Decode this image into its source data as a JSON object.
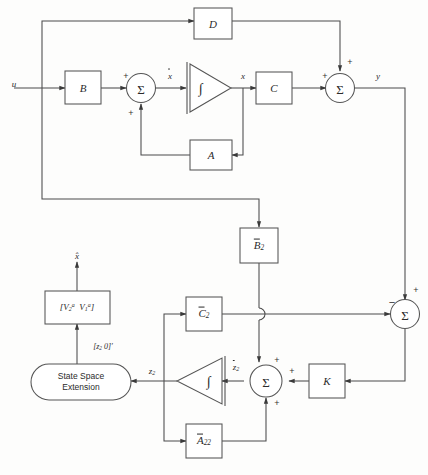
{
  "diagram": {
    "type": "control-system-block-diagram",
    "stroke_color": "#4a4a4a",
    "text_color": "#2b2b2b",
    "background": "#fdfdfc"
  },
  "blocks": {
    "d": {
      "label": "D",
      "shape": "rect"
    },
    "b": {
      "label": "B",
      "shape": "rect"
    },
    "a": {
      "label": "A",
      "shape": "rect"
    },
    "c": {
      "label": "C",
      "shape": "rect"
    },
    "b2": {
      "label": "B̅2",
      "shape": "rect",
      "base": "B",
      "overbar": true,
      "subscript": "2"
    },
    "c2": {
      "label": "C̅2",
      "shape": "rect",
      "base": "C",
      "overbar": true,
      "subscript": "2"
    },
    "a22": {
      "label": "A̅22",
      "shape": "rect",
      "base": "A",
      "overbar": true,
      "subscript": "22"
    },
    "k": {
      "label": "K",
      "shape": "rect"
    },
    "vmatrix": {
      "label": "[V2ᵃ V1ᵃ]",
      "shape": "rect"
    },
    "sse": {
      "line1": "State Space",
      "line2": "Extension",
      "shape": "stadium"
    }
  },
  "sum_junctions": {
    "sum_state": {
      "glyph": "Σ",
      "signs": [
        "+",
        "+"
      ]
    },
    "sum_output": {
      "glyph": "Σ",
      "signs": [
        "+",
        "+"
      ]
    },
    "sum_error": {
      "glyph": "Σ",
      "signs": [
        "-",
        "+"
      ]
    },
    "sum_obs": {
      "glyph": "Σ",
      "signs": [
        "+",
        "+",
        "+"
      ]
    }
  },
  "integrators": {
    "upper": {
      "glyph": "∫",
      "direction": "right"
    },
    "lower": {
      "glyph": "∫",
      "direction": "left"
    }
  },
  "signals": {
    "u": "u",
    "xdot": "ẋ",
    "x": "x",
    "y": "y",
    "z2": "z2",
    "z2dot": "ż2",
    "xhat": "x̂",
    "z2_zero_vec": "[z2 0]′"
  },
  "signs": {
    "plus": "+",
    "minus": "−"
  }
}
